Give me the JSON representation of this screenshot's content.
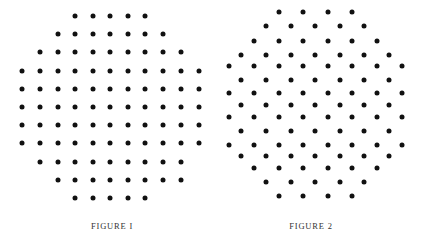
{
  "figures": [
    {
      "caption": "FIGURE I",
      "caption_x": 112,
      "caption_y": 226,
      "lattice": "square",
      "dot_color": "#111111",
      "rows": [
        {
          "y": 16,
          "xs": [
            75,
            93,
            110,
            128,
            145
          ]
        },
        {
          "y": 34,
          "xs": [
            58,
            75,
            93,
            110,
            128,
            145,
            163
          ]
        },
        {
          "y": 52,
          "xs": [
            40,
            58,
            75,
            93,
            110,
            128,
            145,
            163,
            181
          ]
        },
        {
          "y": 70.5,
          "xs": [
            22,
            40,
            58,
            75,
            93,
            110,
            128,
            145,
            163,
            181,
            199
          ]
        },
        {
          "y": 88.5,
          "xs": [
            22,
            40,
            58,
            75,
            93,
            110,
            128,
            145,
            163,
            181,
            199
          ]
        },
        {
          "y": 107,
          "xs": [
            22,
            40,
            58,
            75,
            93,
            110,
            128,
            145,
            163,
            181,
            199
          ]
        },
        {
          "y": 125,
          "xs": [
            22,
            40,
            58,
            75,
            93,
            110,
            128,
            145,
            163,
            181,
            199
          ]
        },
        {
          "y": 143,
          "xs": [
            22,
            40,
            58,
            75,
            93,
            110,
            128,
            145,
            163,
            181,
            199
          ]
        },
        {
          "y": 161.5,
          "xs": [
            40,
            58,
            75,
            93,
            110,
            128,
            145,
            163,
            181
          ]
        },
        {
          "y": 180,
          "xs": [
            58,
            75,
            93,
            110,
            128,
            145,
            163,
            181
          ]
        },
        {
          "y": 198,
          "xs": [
            75,
            93,
            110,
            128,
            145
          ]
        }
      ]
    },
    {
      "caption": "FIGURE 2",
      "caption_x": 311,
      "caption_y": 226,
      "lattice": "triangular",
      "dot_color": "#111111",
      "rows": [
        {
          "y": 12,
          "xs": [
            278.5,
            303,
            327.5,
            352
          ]
        },
        {
          "y": 26,
          "xs": [
            266,
            290.5,
            315,
            339.5,
            364
          ]
        },
        {
          "y": 40.5,
          "xs": [
            253.5,
            278.5,
            303,
            327.5,
            352,
            376.5
          ]
        },
        {
          "y": 54.5,
          "xs": [
            241,
            266,
            290.5,
            315,
            339.5,
            364,
            389
          ]
        },
        {
          "y": 66,
          "xs": [
            228.5,
            253.5,
            278.5,
            303,
            327.5,
            352,
            376.5,
            401.5
          ]
        },
        {
          "y": 80,
          "xs": [
            241,
            266,
            290.5,
            315,
            339.5,
            364,
            389
          ]
        },
        {
          "y": 92.5,
          "xs": [
            228.5,
            253.5,
            278.5,
            303,
            327.5,
            352,
            376.5,
            401.5
          ]
        },
        {
          "y": 104.5,
          "xs": [
            241,
            266,
            290.5,
            315,
            339.5,
            364,
            389
          ]
        },
        {
          "y": 117,
          "xs": [
            228.5,
            253.5,
            278.5,
            303,
            327.5,
            352,
            376.5,
            401.5
          ]
        },
        {
          "y": 130.5,
          "xs": [
            241,
            266,
            290.5,
            315,
            339.5,
            364,
            389
          ]
        },
        {
          "y": 144.5,
          "xs": [
            228.5,
            253.5,
            278.5,
            303,
            327.5,
            352,
            376.5,
            401.5
          ]
        },
        {
          "y": 155.5,
          "xs": [
            241,
            266,
            290.5,
            315,
            339.5,
            364,
            389
          ]
        },
        {
          "y": 167.5,
          "xs": [
            253.5,
            278.5,
            303,
            327.5,
            352,
            376.5
          ]
        },
        {
          "y": 182,
          "xs": [
            266,
            290.5,
            315,
            339.5,
            364
          ]
        },
        {
          "y": 196,
          "xs": [
            278.5,
            303,
            327.5,
            352
          ]
        }
      ]
    }
  ]
}
